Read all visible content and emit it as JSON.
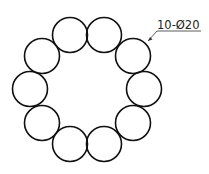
{
  "drawing": {
    "type": "circular hole pattern",
    "annotation": "10-Ø20",
    "hole_count": 10,
    "hole_diameter_label": "Ø20",
    "pattern_center": [
      87,
      89
    ],
    "pattern_radius": 57,
    "hole_radius_px": 17.5,
    "holes": [
      {
        "cx": 70,
        "cy": 35
      },
      {
        "cx": 104,
        "cy": 35
      },
      {
        "cx": 133,
        "cy": 56
      },
      {
        "cx": 144,
        "cy": 89
      },
      {
        "cx": 133,
        "cy": 123
      },
      {
        "cx": 104,
        "cy": 144
      },
      {
        "cx": 70,
        "cy": 144
      },
      {
        "cx": 42,
        "cy": 123
      },
      {
        "cx": 30,
        "cy": 89
      },
      {
        "cx": 42,
        "cy": 56
      }
    ],
    "colors": {
      "stroke": "#111111",
      "background": "#ffffff"
    }
  }
}
